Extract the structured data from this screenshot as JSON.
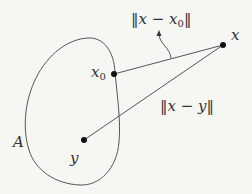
{
  "diagram": {
    "set_label": "A",
    "points": {
      "x": {
        "label": "x",
        "cx": 223,
        "cy": 45
      },
      "x0": {
        "label": "x",
        "subscript": "0",
        "cx": 114,
        "cy": 74
      },
      "y": {
        "label": "y",
        "cx": 84,
        "cy": 140
      }
    },
    "annotations": {
      "dist_x_x0": {
        "prefix": "‖x − x",
        "subscript": "0",
        "suffix": "‖"
      },
      "dist_x_y": "‖x − y‖"
    },
    "colors": {
      "stroke": "#555555",
      "point": "#111111",
      "text": "#333333",
      "background": "#f6f6f3"
    }
  }
}
